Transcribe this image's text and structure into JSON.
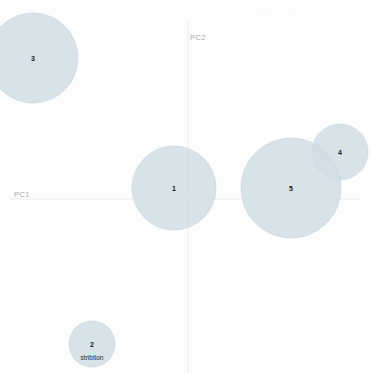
{
  "chart_data": {
    "type": "scatter",
    "title": "",
    "xlabel": "PC1",
    "ylabel": "PC2",
    "grid": false,
    "legend": "none",
    "axis_origin": {
      "x": 188,
      "y": 199
    },
    "xlim": [
      -188,
      187
    ],
    "ylim": [
      -174,
      199
    ],
    "points": [
      {
        "label": "1",
        "sublabel": "",
        "cx": 174,
        "cy": 188,
        "r": 42,
        "pc1": -14,
        "pc2": 11,
        "size": 42
      },
      {
        "label": "2",
        "sublabel": "stribtion",
        "cx": 92,
        "cy": 344,
        "r": 23,
        "pc1": -96,
        "pc2": -145,
        "size": 23
      },
      {
        "label": "3",
        "sublabel": "",
        "cx": 33,
        "cy": 58,
        "r": 45,
        "pc1": -155,
        "pc2": 141,
        "size": 45
      },
      {
        "label": "4",
        "sublabel": "",
        "cx": 340,
        "cy": 152,
        "r": 28,
        "pc1": 152,
        "pc2": 47,
        "size": 28
      },
      {
        "label": "5",
        "sublabel": "",
        "cx": 291,
        "cy": 188,
        "r": 50,
        "pc1": 103,
        "pc2": 11,
        "size": 50
      }
    ],
    "artifacts": [
      {
        "text": "··",
        "x": 263,
        "y": 8
      },
      {
        "text": "···",
        "x": 289,
        "y": 7
      }
    ]
  },
  "style": {
    "bubble_fill": "#cfdde4",
    "bubble_stroke": "#c2d3db",
    "bubble_opacity": 0.82,
    "axis_color": "#e8eaec",
    "axis_label_color": "#a9a9a9",
    "label_color": "#15181d",
    "background": "#fdfdfd"
  }
}
